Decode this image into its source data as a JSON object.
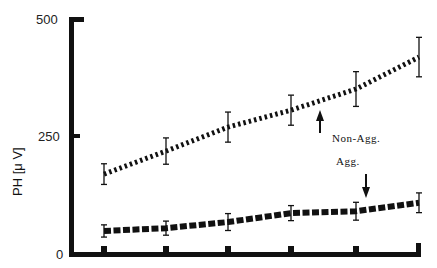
{
  "chart_data": {
    "type": "line",
    "title": "",
    "xlabel": "",
    "ylabel": "PH [μ V]",
    "ylim": [
      0,
      500
    ],
    "yticks": [
      0,
      250,
      500
    ],
    "ytick_labels": [
      "0",
      "250",
      "500"
    ],
    "x": [
      1,
      2,
      3,
      4,
      5,
      6
    ],
    "xtick_labels": [
      "",
      "",
      "",
      "",
      "",
      ""
    ],
    "grid": false,
    "legend": "none (inline annotations with arrows)",
    "series": [
      {
        "name": "Non-Agg.",
        "style": "hatched dashed (thin diagonal stripes)",
        "values": [
          170,
          219,
          270,
          306,
          351,
          419
        ],
        "error": [
          22,
          28,
          32,
          32,
          37,
          42
        ]
      },
      {
        "name": "Agg.",
        "style": "heavy dashed",
        "values": [
          49,
          55,
          68,
          87,
          91,
          109
        ],
        "error": [
          13,
          15,
          18,
          16,
          19,
          21
        ]
      }
    ],
    "annotations": [
      {
        "text": "Non-Agg.",
        "arrow": "up",
        "points_to": "Non-Agg. series between x=4 and x=5"
      },
      {
        "text": "Agg.",
        "arrow": "down",
        "points_to": "Agg. series near x=5"
      }
    ]
  },
  "labels": {
    "y_axis_title": "PH [μ V]",
    "y_500": "500",
    "y_250": "250",
    "y_0": "0",
    "non_agg": "Non-Agg.",
    "agg": "Agg."
  },
  "colors": {
    "ink": "#111111",
    "background": "#ffffff"
  }
}
